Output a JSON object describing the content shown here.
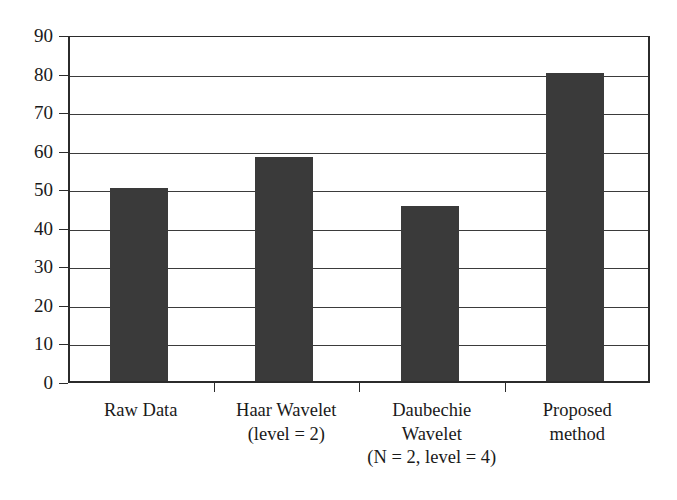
{
  "chart_data": {
    "type": "bar",
    "title": "",
    "subtitle": "",
    "xlabel": "",
    "ylabel": "",
    "categories": [
      "Raw Data",
      "Haar Wavelet\n(level = 2)",
      "Daubechie Wavelet\n(N = 2, level = 4)",
      "Proposed method"
    ],
    "category_lines": [
      [
        "Raw Data"
      ],
      [
        "Haar Wavelet",
        "(level = 2)"
      ],
      [
        "Daubechie",
        "Wavelet",
        "(N = 2, level = 4)"
      ],
      [
        "Proposed",
        "method"
      ]
    ],
    "values": [
      50,
      58,
      45.5,
      80
    ],
    "ylim": [
      0,
      90
    ],
    "ytick_step": 10,
    "ytick_labels": [
      "90",
      "80",
      "70",
      "60",
      "50",
      "40",
      "30",
      "20",
      "10",
      "0"
    ],
    "ytick_values": [
      90,
      80,
      70,
      60,
      50,
      40,
      30,
      20,
      10,
      0
    ],
    "grid": true,
    "grid_axis": "y",
    "legend": "none",
    "bar_color": "#3a3a3a",
    "axis_color": "#2b2b2b",
    "grid_color": "#3b3b3b",
    "background_color": "#ffffff"
  }
}
